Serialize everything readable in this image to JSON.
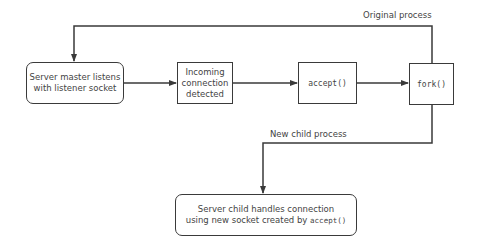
{
  "diagram": {
    "type": "flowchart",
    "nodes": [
      {
        "id": "master",
        "label_line1": "Server master listens",
        "label_line2": "with listener socket",
        "shape": "rounded-rect"
      },
      {
        "id": "incoming",
        "label_line1": "Incoming",
        "label_line2": "connection",
        "label_line3": "detected",
        "shape": "rect"
      },
      {
        "id": "accept",
        "label": "accept()",
        "shape": "rect"
      },
      {
        "id": "fork",
        "label": "fork()",
        "shape": "rect"
      },
      {
        "id": "child",
        "label_line1": "Server child handles connection",
        "label_line2_prefix": "using new socket created by ",
        "label_line2_code": "accept()",
        "shape": "rounded-rect"
      }
    ],
    "edges": [
      {
        "from": "master",
        "to": "incoming"
      },
      {
        "from": "incoming",
        "to": "accept"
      },
      {
        "from": "accept",
        "to": "fork"
      },
      {
        "from": "fork",
        "to": "master",
        "label": "Original process"
      },
      {
        "from": "fork",
        "to": "child",
        "label": "New child process"
      }
    ],
    "edge_labels": {
      "original": "Original process",
      "child": "New child process"
    },
    "colors": {
      "stroke": "#3a3a3a",
      "background": "#ffffff",
      "text": "#444444"
    }
  }
}
